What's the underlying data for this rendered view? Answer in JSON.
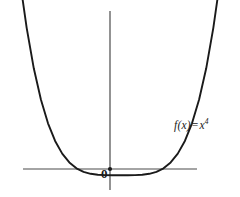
{
  "figure": {
    "background_color": "#ffffff",
    "axis_color": "#4a4a4a",
    "curve_color": "#1a1a1a",
    "text_color": "#1a1a1a",
    "origin_label": "0",
    "function_label": {
      "fn": "f(x)",
      "equals": "=",
      "base": "x",
      "exponent": "4",
      "full": "f(x) = x⁴"
    }
  },
  "chart_data": {
    "type": "line",
    "title": "",
    "subtitle": "",
    "xlabel": "",
    "ylabel": "",
    "legend": [
      "f(x) = x⁴"
    ],
    "legend_position": "inline-right",
    "grid": false,
    "axes_style": "cartesian-crosshair",
    "xlim": [
      -1.35,
      1.35
    ],
    "ylim": [
      -0.18,
      1.45
    ],
    "x_axis_pixel_y": 169,
    "y_axis_pixel_x": 110,
    "x_axis_pixel_range": [
      23,
      197
    ],
    "y_axis_pixel_range": [
      11,
      190
    ],
    "origin_marker": true,
    "annotations": [
      {
        "text": "0",
        "x": -0.07,
        "y": -0.09
      },
      {
        "text": "f(x) = x⁴",
        "x": 0.78,
        "y": 0.42
      }
    ],
    "series": [
      {
        "name": "f(x) = x⁴",
        "equation": "y = x^4",
        "x": [
          -1.13,
          -1.05,
          -0.97,
          -0.89,
          -0.81,
          -0.73,
          -0.65,
          -0.57,
          -0.49,
          -0.41,
          -0.33,
          -0.25,
          -0.17,
          -0.09,
          0.0,
          0.09,
          0.17,
          0.25,
          0.33,
          0.41,
          0.49,
          0.57,
          0.65,
          0.73,
          0.81,
          0.89,
          0.97,
          1.05,
          1.13
        ],
        "values": [
          1.63,
          1.22,
          0.885,
          0.627,
          0.43,
          0.284,
          0.179,
          0.106,
          0.0576,
          0.0283,
          0.0119,
          0.0039,
          0.00084,
          7e-05,
          0.0,
          7e-05,
          0.00084,
          0.0039,
          0.0119,
          0.0283,
          0.0576,
          0.106,
          0.179,
          0.284,
          0.43,
          0.627,
          0.885,
          1.22,
          1.63
        ]
      }
    ]
  }
}
